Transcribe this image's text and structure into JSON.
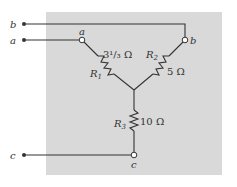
{
  "diagram": {
    "type": "wye-circuit",
    "colors": {
      "background": "#ffffff",
      "panel": "#d9d9d9",
      "wire": "#333333"
    },
    "terminals": {
      "external": [
        {
          "label": "b"
        },
        {
          "label": "a"
        },
        {
          "label": "c"
        }
      ],
      "nodes": [
        {
          "label": "a"
        },
        {
          "label": "b"
        },
        {
          "label": "c"
        }
      ]
    },
    "resistors": [
      {
        "name": "R",
        "sub": "1",
        "value": "3¹/₃ Ω"
      },
      {
        "name": "R",
        "sub": "2",
        "value": "5 Ω"
      },
      {
        "name": "R",
        "sub": "3",
        "value": "10 Ω"
      }
    ]
  }
}
